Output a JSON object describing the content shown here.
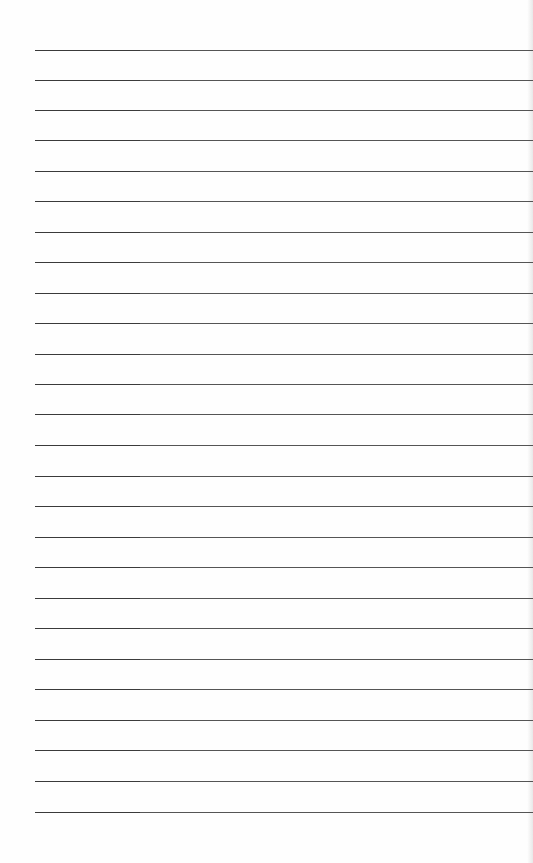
{
  "page": {
    "type": "lined-paper",
    "background": "#fefefe",
    "line_color_left": "#3a3a3a",
    "line_color_main": "#555555",
    "line_left_x": 35,
    "line_count": 26,
    "lines_y": [
      50,
      80,
      110,
      140,
      171,
      201,
      232,
      262,
      293,
      323,
      354,
      384,
      414,
      445,
      476,
      506,
      537,
      567,
      598,
      628,
      659,
      689,
      720,
      750,
      781,
      812
    ]
  }
}
